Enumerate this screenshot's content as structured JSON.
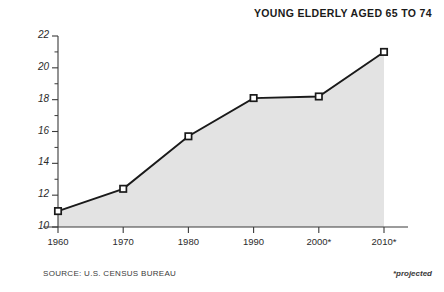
{
  "chart_data": {
    "type": "area",
    "title": "YOUNG ELDERLY AGED 65 TO 74",
    "xlabel": "",
    "ylabel": "",
    "categories": [
      "1960",
      "1970",
      "1980",
      "1990",
      "2000*",
      "2010*"
    ],
    "values": [
      11.0,
      12.4,
      15.7,
      18.1,
      18.2,
      21.0
    ],
    "series": [
      {
        "name": "Young elderly aged 65 to 74 (millions)",
        "values": [
          11.0,
          12.4,
          15.7,
          18.1,
          18.2,
          21.0
        ]
      }
    ],
    "ylim": [
      10,
      22
    ],
    "y_ticks": [
      10,
      12,
      14,
      16,
      18,
      20,
      22
    ],
    "y_tick_labels": [
      "10",
      "12",
      "14",
      "16",
      "18",
      "20",
      "22"
    ],
    "y_minor_ticks": [
      11,
      13,
      15,
      17,
      19,
      21
    ],
    "x_tick_labels": [
      "1960",
      "1970",
      "1980",
      "1990",
      "2000*",
      "2010*"
    ],
    "grid": false,
    "legend": false,
    "legend_position": "none",
    "marker": "square",
    "fill_color": "#e3e3e3",
    "line_color": "#1a1a1a",
    "marker_face_color": "#ffffff",
    "marker_edge_color": "#1a1a1a",
    "axis_color": "#3a3a3a"
  },
  "footer": {
    "source": "SOURCE: U.S. CENSUS BUREAU",
    "projected_note": "*projected"
  },
  "colors": {
    "background": "#ffffff",
    "fill": "#e3e3e3",
    "line": "#1a1a1a",
    "text": "#2b2b2b"
  }
}
